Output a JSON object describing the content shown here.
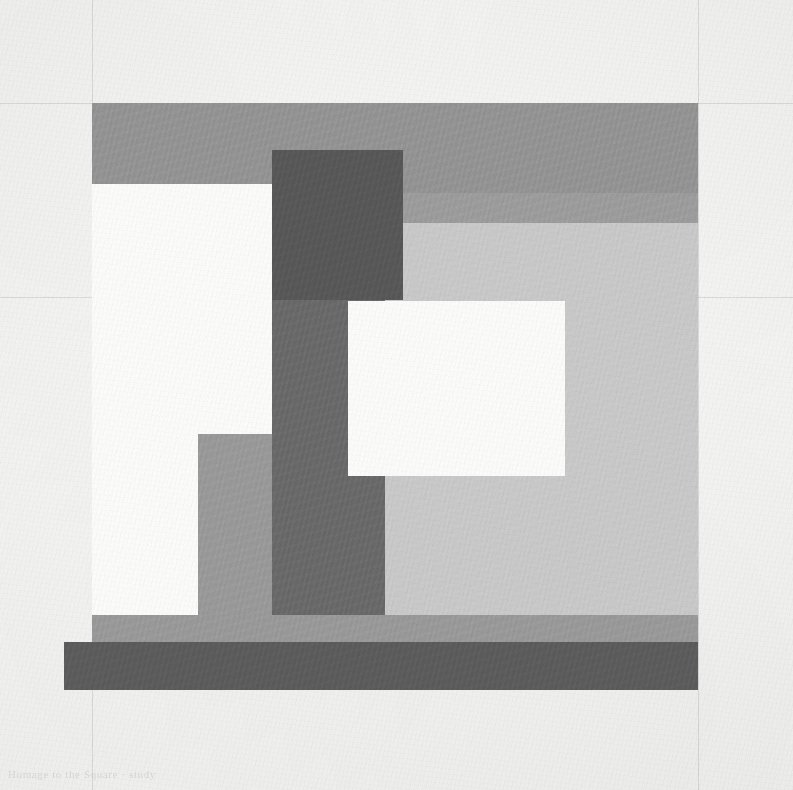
{
  "artwork": {
    "title": "Untitled geometric composition",
    "medium_support": "textured wove paper",
    "inscription": "Homage to the Square  ·  study",
    "palette": {
      "paper": "#f3f3f1",
      "paper_highlight": "#fbfbfa",
      "light_gray_field": "#c9c9c9",
      "mid_gray": "#949494",
      "mid_gray_warm": "#9a9a9a",
      "dark_gray_column": "#6a6a6a",
      "darkest_band": "#5c5c5c",
      "white_plane": "#fbfbfa",
      "pencil_line": "rgba(90,95,105,0.17)"
    },
    "guide_lines": [
      {
        "name": "horizontal-construction-line",
        "orientation": "h",
        "x": 0,
        "y": 297,
        "length": 793
      },
      {
        "name": "vertical-construction-line-left",
        "orientation": "v",
        "x": 92,
        "y": 0,
        "length": 790
      },
      {
        "name": "vertical-construction-line-right",
        "orientation": "v",
        "x": 698,
        "y": 0,
        "length": 790
      },
      {
        "name": "horizontal-faint-line-upper",
        "orientation": "h",
        "x": 0,
        "y": 103,
        "length": 793
      }
    ],
    "shapes": [
      {
        "name": "light-gray-ground-field",
        "role": "large light ground plane",
        "color": "#c9c9c9",
        "x": 92,
        "y": 103,
        "w": 606,
        "h": 587,
        "opacity": 1
      },
      {
        "name": "top-mid-gray-band",
        "role": "upper horizontal band",
        "color": "#949494",
        "x": 92,
        "y": 103,
        "w": 606,
        "h": 119,
        "opacity": 1
      },
      {
        "name": "upper-right-step-band",
        "role": "right step of upper band",
        "color": "#9d9d9d",
        "x": 403,
        "y": 193,
        "w": 295,
        "h": 30,
        "opacity": 1
      },
      {
        "name": "white-left-column",
        "role": "tall white vertical plane at left",
        "color": "#fbfbfa",
        "x": 92,
        "y": 184,
        "w": 180,
        "h": 457,
        "opacity": 1
      },
      {
        "name": "mid-gray-lower-left-block",
        "role": "gray block inset in white column",
        "color": "#9a9a9a",
        "x": 198,
        "y": 434,
        "w": 187,
        "h": 181,
        "opacity": 1
      },
      {
        "name": "dark-gray-vertical-column",
        "role": "central dark vertical column",
        "color": "#6a6a6a",
        "x": 272,
        "y": 150,
        "w": 113,
        "h": 465,
        "opacity": 1
      },
      {
        "name": "dark-gray-upper-head-block",
        "role": "wider dark head of central column",
        "color": "#585858",
        "x": 272,
        "y": 150,
        "w": 131,
        "h": 150,
        "opacity": 1
      },
      {
        "name": "white-center-square",
        "role": "floating white square",
        "color": "#fbfbfa",
        "x": 348,
        "y": 301,
        "w": 217,
        "h": 175,
        "opacity": 1
      },
      {
        "name": "lower-mid-gray-band",
        "role": "band above bottom dark band",
        "color": "#9a9a9a",
        "x": 92,
        "y": 615,
        "w": 606,
        "h": 27,
        "opacity": 1
      },
      {
        "name": "bottom-dark-band",
        "role": "bottom horizontal dark band",
        "color": "#5c5c5c",
        "x": 64,
        "y": 642,
        "w": 634,
        "h": 48,
        "opacity": 1
      }
    ]
  }
}
